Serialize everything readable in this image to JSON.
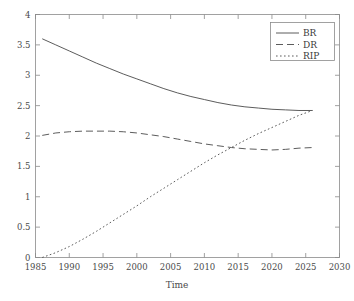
{
  "chart_data": {
    "type": "line",
    "title": "",
    "xlabel": "Time",
    "ylabel": "",
    "xlim": [
      1985,
      2030
    ],
    "ylim": [
      0,
      4
    ],
    "grid": false,
    "legend_position": "top-right",
    "xticks": [
      "1985",
      "1990",
      "1995",
      "2000",
      "2005",
      "2010",
      "2015",
      "2020",
      "2025",
      "2030"
    ],
    "xtick_values": [
      1985,
      1990,
      1995,
      2000,
      2005,
      2010,
      2015,
      2020,
      2025,
      2030
    ],
    "yticks": [
      "0",
      "0.5",
      "1",
      "1.5",
      "2",
      "2.5",
      "3",
      "3.5",
      "4"
    ],
    "ytick_values": [
      0,
      0.5,
      1,
      1.5,
      2,
      2.5,
      3,
      3.5,
      4
    ],
    "x": [
      1986,
      1988,
      1990,
      1992,
      1994,
      1996,
      1998,
      2000,
      2002,
      2004,
      2006,
      2008,
      2010,
      2012,
      2014,
      2016,
      2018,
      2020,
      2022,
      2024,
      2026
    ],
    "series": [
      {
        "name": "BR",
        "style": "solid",
        "color": "#4a4a4a",
        "values": [
          3.6,
          3.5,
          3.4,
          3.3,
          3.2,
          3.11,
          3.02,
          2.94,
          2.86,
          2.78,
          2.71,
          2.65,
          2.6,
          2.55,
          2.51,
          2.48,
          2.46,
          2.44,
          2.43,
          2.42,
          2.42
        ]
      },
      {
        "name": "DR",
        "style": "dashed",
        "color": "#4a4a4a",
        "values": [
          2.01,
          2.05,
          2.07,
          2.08,
          2.08,
          2.08,
          2.07,
          2.05,
          2.02,
          1.99,
          1.95,
          1.91,
          1.87,
          1.84,
          1.81,
          1.79,
          1.78,
          1.77,
          1.78,
          1.8,
          1.81
        ]
      },
      {
        "name": "RIP",
        "style": "dotted",
        "color": "#4a4a4a",
        "values": [
          0.0,
          0.08,
          0.18,
          0.3,
          0.43,
          0.57,
          0.71,
          0.85,
          1.0,
          1.14,
          1.28,
          1.42,
          1.56,
          1.69,
          1.81,
          1.93,
          2.04,
          2.14,
          2.24,
          2.34,
          2.42
        ]
      }
    ],
    "annotations": {
      "br_rip_convergence": "BR and RIP converge near 2.42 around 2026",
      "dr_rip_crossing": "DR and RIP cross near 1.80 around 2014"
    }
  },
  "legend": {
    "entries": [
      {
        "label": "BR",
        "style": "solid"
      },
      {
        "label": "DR",
        "style": "dashed"
      },
      {
        "label": "RIP",
        "style": "dotted"
      }
    ]
  },
  "colors": {
    "background": "#ffffff",
    "axis": "#8a8a8a",
    "text": "#4a4a4a",
    "line": "#4a4a4a"
  }
}
